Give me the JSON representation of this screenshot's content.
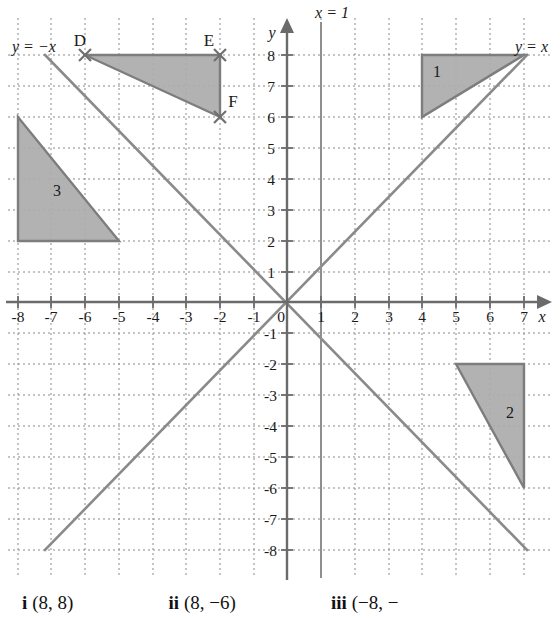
{
  "figure": {
    "colors": {
      "shape_fill": "#ababab",
      "shape_stroke": "#7d7d7d",
      "axis": "#6b6b6b",
      "grid": "#8a8a8a",
      "line": "#8a8a8a",
      "text": "#1a1a1a"
    }
  },
  "axes": {
    "x_label": "x",
    "y_label": "y",
    "x_ticks": [
      "-8",
      "-7",
      "-6",
      "-5",
      "-4",
      "-3",
      "-2",
      "-1",
      "1",
      "2",
      "3",
      "4",
      "5",
      "6",
      "7",
      "8"
    ],
    "y_ticks": [
      "8",
      "7",
      "6",
      "5",
      "4",
      "3",
      "2",
      "1",
      "-1",
      "-2",
      "-3",
      "-4",
      "-5",
      "-6",
      "-7",
      "-8"
    ],
    "origin_label": "0",
    "xlim": [
      -9,
      9
    ],
    "ylim": [
      -8.6,
      8.8
    ],
    "grid": true
  },
  "lines": [
    {
      "name": "y-equals-negative-x",
      "label": "y = −x",
      "equation": "y = -x",
      "from": [
        -8,
        8
      ],
      "to": [
        8,
        -8
      ]
    },
    {
      "name": "y-equals-x",
      "label": "y = x",
      "equation": "y = x",
      "from": [
        -8,
        -8
      ],
      "to": [
        8,
        8
      ]
    },
    {
      "name": "x-equals-1",
      "label": "x = 1",
      "equation": "x = 1",
      "from": [
        1,
        -8.6
      ],
      "to": [
        1,
        8.8
      ]
    }
  ],
  "shapes": [
    {
      "name": "triangle-def",
      "label": "",
      "vertices": [
        [
          -6,
          8
        ],
        [
          -2,
          8
        ],
        [
          -2,
          6
        ]
      ],
      "vertex_labels": [
        {
          "text": "D",
          "point": [
            -6,
            8
          ]
        },
        {
          "text": "E",
          "point": [
            -2,
            8
          ]
        },
        {
          "text": "F",
          "point": [
            -2,
            6
          ]
        }
      ],
      "markers": [
        [
          -6,
          8
        ],
        [
          -2,
          8
        ],
        [
          -2,
          6
        ]
      ]
    },
    {
      "name": "triangle-1",
      "label": "1",
      "label_point": [
        5.5,
        7.1
      ],
      "vertices": [
        [
          4,
          8
        ],
        [
          8,
          8
        ],
        [
          4,
          6
        ]
      ],
      "vertex_labels": [],
      "markers": []
    },
    {
      "name": "triangle-2",
      "label": "2",
      "label_point": [
        7.3,
        -3.6
      ],
      "vertices": [
        [
          6,
          -2
        ],
        [
          8,
          -2
        ],
        [
          8,
          -6
        ]
      ],
      "vertex_labels": [],
      "markers": []
    },
    {
      "name": "triangle-3",
      "label": "3",
      "label_point": [
        -7.35,
        3.5
      ],
      "vertices": [
        [
          -8,
          6
        ],
        [
          -8,
          2
        ],
        [
          -5,
          2
        ]
      ],
      "vertex_labels": [],
      "markers": []
    }
  ],
  "answers": {
    "items": [
      {
        "key": "i",
        "value": "(8, 8)"
      },
      {
        "key": "ii",
        "value": "(8, −6)"
      },
      {
        "key": "iii",
        "value": "(−8, −"
      }
    ]
  }
}
